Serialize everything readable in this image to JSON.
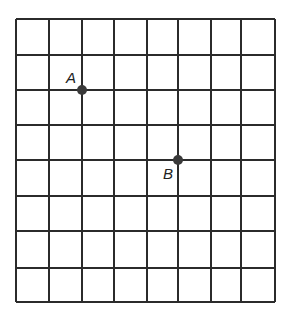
{
  "diagram": {
    "type": "coordinate-grid",
    "columns": 8,
    "rows": 8,
    "line_color": "#2b2b2b",
    "point_color": "#3a3a3a",
    "vertical_lines_x": [
      16,
      49,
      82,
      114,
      147,
      178,
      211,
      241,
      275
    ],
    "horizontal_lines_y": [
      19,
      55,
      90,
      125,
      160,
      196,
      231,
      268,
      302
    ],
    "points": [
      {
        "name": "A",
        "label": "A",
        "grid_col": 2,
        "grid_row": 2,
        "x": 82,
        "y": 90,
        "label_x": 66,
        "label_y": 83
      },
      {
        "name": "B",
        "label": "B",
        "grid_col": 5,
        "grid_row": 4,
        "x": 178,
        "y": 160,
        "label_x": 163,
        "label_y": 179
      }
    ]
  }
}
